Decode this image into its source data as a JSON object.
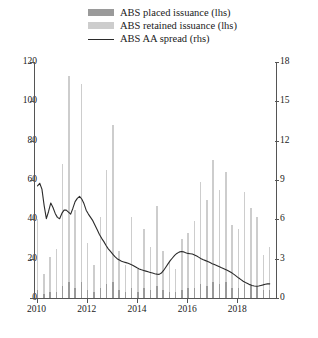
{
  "legend": {
    "items": [
      {
        "label": "ABS placed issuance (lhs)",
        "marker": "bar-dark-swatch",
        "color": "#9a9a9a"
      },
      {
        "label": "ABS retained issuance (lhs)",
        "marker": "bar-light-swatch",
        "color": "#cdcdcd"
      },
      {
        "label": "ABS AA spread (rhs)",
        "marker": "line-swatch",
        "color": "#2b2b2b"
      }
    ]
  },
  "chart_data": {
    "type": "bar",
    "title": "",
    "xlabel": "",
    "ylabel": "",
    "y2label": "",
    "ylim": [
      0,
      120
    ],
    "y2lim": [
      0,
      18
    ],
    "yticks": [
      0,
      20,
      40,
      60,
      80,
      100,
      120
    ],
    "y2ticks": [
      0,
      3,
      6,
      9,
      12,
      15,
      18
    ],
    "grid": false,
    "legend_position": "top",
    "x_tick_labels": [
      "2010",
      "2012",
      "2014",
      "2016",
      "2018"
    ],
    "x_tick_values": [
      2010,
      2012,
      2014,
      2016,
      2018
    ],
    "x_range": [
      2009.9,
      2019.5
    ],
    "x": [
      2010.0,
      2010.25,
      2010.5,
      2010.75,
      2011.0,
      2011.25,
      2011.5,
      2011.75,
      2012.0,
      2012.25,
      2012.5,
      2012.75,
      2013.0,
      2013.25,
      2013.5,
      2013.75,
      2014.0,
      2014.25,
      2014.5,
      2014.75,
      2015.0,
      2015.25,
      2015.5,
      2015.75,
      2016.0,
      2016.25,
      2016.5,
      2016.75,
      2017.0,
      2017.25,
      2017.5,
      2017.75,
      2018.0,
      2018.25,
      2018.5,
      2018.75,
      2019.0,
      2019.25
    ],
    "series": [
      {
        "name": "ABS retained issuance (lhs)",
        "axis": "left",
        "type": "bar",
        "color": "#cdcdcd",
        "values": [
          36,
          10,
          18,
          22,
          62,
          105,
          40,
          101,
          24,
          14,
          36,
          58,
          80,
          20,
          14,
          36,
          12,
          30,
          22,
          41,
          20,
          16,
          12,
          26,
          28,
          34,
          52,
          44,
          62,
          48,
          56,
          32,
          30,
          47,
          40,
          35,
          18,
          22
        ]
      },
      {
        "name": "ABS placed issuance (lhs)",
        "axis": "left",
        "type": "bar",
        "color": "#9a9a9a",
        "values": [
          4,
          2,
          3,
          3,
          6,
          8,
          5,
          8,
          4,
          3,
          5,
          7,
          8,
          4,
          3,
          5,
          3,
          5,
          4,
          6,
          4,
          3,
          3,
          4,
          5,
          5,
          7,
          6,
          8,
          7,
          8,
          5,
          5,
          7,
          6,
          6,
          4,
          4
        ]
      },
      {
        "name": "ABS AA spread (rhs)",
        "axis": "right",
        "type": "line",
        "color": "#2b2b2b",
        "values": [
          8.6,
          7.8,
          8.2,
          6.1,
          6.3,
          6.6,
          7.0,
          7.7,
          7.6,
          6.1,
          5.0,
          4.2,
          3.6,
          3.2,
          2.9,
          2.6,
          2.3,
          2.0,
          1.8,
          1.7,
          2.2,
          2.4,
          2.9,
          3.3,
          3.6,
          3.2,
          2.8,
          2.6,
          2.5,
          2.4,
          2.3,
          2.2,
          2.0,
          1.7,
          1.4,
          1.1,
          0.85,
          0.95
        ]
      }
    ],
    "spread_dense": [
      8.55,
      8.75,
      8.3,
      7.05,
      6.05,
      6.6,
      7.25,
      6.9,
      6.45,
      6.15,
      6.05,
      6.45,
      6.7,
      6.7,
      6.55,
      6.4,
      6.85,
      7.35,
      7.6,
      7.75,
      7.55,
      7.2,
      6.7,
      6.4,
      6.15,
      5.9,
      5.55,
      5.2,
      4.85,
      4.55,
      4.3,
      4.0,
      3.75,
      3.55,
      3.35,
      3.15,
      3.0,
      2.9,
      2.8,
      2.75,
      2.7,
      2.65,
      2.58,
      2.5,
      2.4,
      2.3,
      2.22,
      2.15,
      2.1,
      2.05,
      2.0,
      1.95,
      1.9,
      1.85,
      1.82,
      1.8,
      1.9,
      2.1,
      2.35,
      2.6,
      2.85,
      3.05,
      3.25,
      3.4,
      3.5,
      3.55,
      3.52,
      3.45,
      3.4,
      3.38,
      3.35,
      3.28,
      3.2,
      3.1,
      3.0,
      2.92,
      2.85,
      2.78,
      2.7,
      2.62,
      2.55,
      2.48,
      2.4,
      2.32,
      2.25,
      2.18,
      2.1,
      2.0,
      1.9,
      1.78,
      1.65,
      1.52,
      1.4,
      1.28,
      1.18,
      1.1,
      1.02,
      0.95,
      0.92,
      0.9,
      0.92,
      0.96,
      1.0,
      1.05,
      1.08,
      1.08
    ]
  }
}
